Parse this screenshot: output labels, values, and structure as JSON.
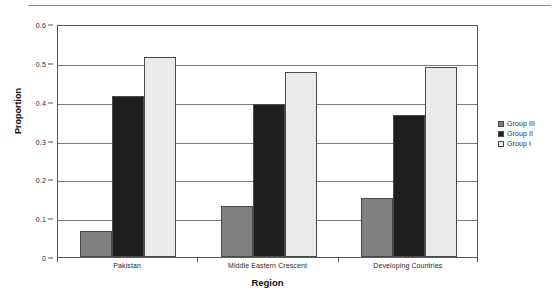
{
  "chart_data": {
    "type": "bar",
    "title": "",
    "xlabel": "Region",
    "ylabel": "Proportion",
    "categories": [
      "Pakistan",
      "Middle Eastern Crescent",
      "Developing Countries"
    ],
    "series": [
      {
        "name": "Group III",
        "color": "#808080",
        "values": [
          0.068,
          0.132,
          0.153
        ]
      },
      {
        "name": "Group II",
        "color": "#1f1f1f",
        "values": [
          0.415,
          0.393,
          0.365
        ]
      },
      {
        "name": "Group I",
        "color": "#ebebeb",
        "values": [
          0.515,
          0.477,
          0.489
        ]
      }
    ],
    "ylim": [
      0,
      0.6
    ],
    "yticks": [
      0,
      0.1,
      0.2,
      0.3,
      0.4,
      0.5,
      0.6
    ],
    "ytick_labels": [
      "0",
      "0.1",
      "0.2",
      "0.3",
      "0.4",
      "0.5",
      "0.6"
    ],
    "grid": true,
    "grid_axis": "y",
    "legend_position": "right",
    "bar_edge_color": "#4a4a4c",
    "axis_color": "#59595b"
  }
}
